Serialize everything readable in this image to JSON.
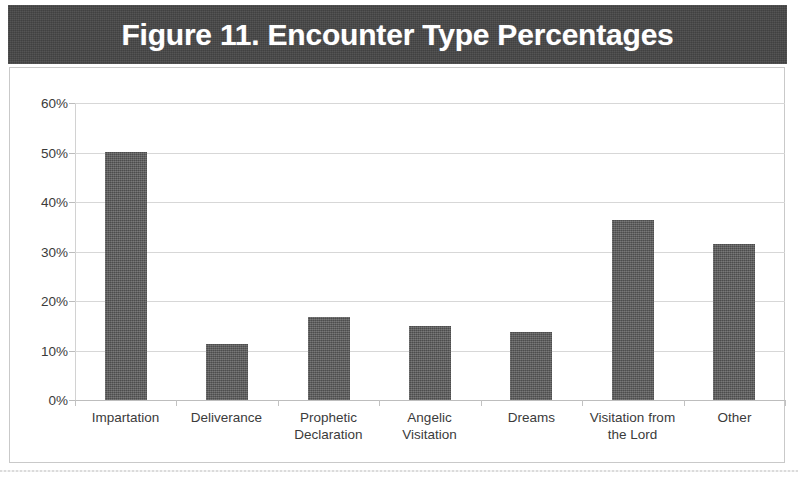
{
  "figure": {
    "title": "Figure 11. Encounter Type Percentages",
    "title_band_color": "#464646",
    "bar_color": "#5c5c5c",
    "background_color": "#ffffff",
    "border_color": "#c9c9c9"
  },
  "chart_data": {
    "type": "bar",
    "title": "Figure 11. Encounter Type Percentages",
    "xlabel": "",
    "ylabel": "",
    "categories": [
      "Impartation",
      "Deliverance",
      "Prophetic Declaration",
      "Angelic Visitation",
      "Dreams",
      "Visitation from the Lord",
      "Other"
    ],
    "category_lines": [
      [
        "Impartation"
      ],
      [
        "Deliverance"
      ],
      [
        "Prophetic",
        "Declaration"
      ],
      [
        "Angelic",
        "Visitation"
      ],
      [
        "Dreams"
      ],
      [
        "Visitation from",
        "the Lord"
      ],
      [
        "Other"
      ]
    ],
    "values": [
      50.0,
      11.3,
      16.8,
      15.0,
      13.8,
      36.4,
      31.5
    ],
    "value_unit": "%",
    "ylim": [
      0,
      60
    ],
    "yticks": [
      0,
      10,
      20,
      30,
      40,
      50,
      60
    ],
    "ytick_labels": [
      "0%",
      "10%",
      "20%",
      "30%",
      "40%",
      "50%",
      "60%"
    ],
    "grid": true,
    "legend": false,
    "legend_position": "none",
    "series": [
      {
        "name": "Encounter Type Percentage",
        "values": [
          50.0,
          11.3,
          16.8,
          15.0,
          13.8,
          36.4,
          31.5
        ]
      }
    ]
  }
}
